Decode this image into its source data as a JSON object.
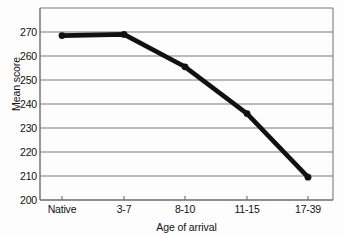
{
  "chart_data": {
    "type": "line",
    "title": "",
    "xlabel": "Age of arrival",
    "ylabel": "Mean score",
    "categories": [
      "Native",
      "3-7",
      "8-10",
      "11-15",
      "17-39"
    ],
    "values": [
      268.5,
      269,
      255.5,
      236,
      209.5
    ],
    "series": [
      {
        "name": "Mean score",
        "values": [
          268.5,
          269,
          255.5,
          236,
          209.5
        ]
      }
    ],
    "ylim": [
      200,
      275
    ],
    "y_ticks": [
      200,
      210,
      220,
      230,
      240,
      250,
      260,
      270
    ],
    "y_tick_labels": [
      "200",
      "210",
      "220",
      "230",
      "240",
      "250",
      "260",
      "270"
    ],
    "x_ticks": [
      "Native",
      "3-7",
      "8-10",
      "11-15",
      "17-39"
    ],
    "grid": "horizontal",
    "legend": "none",
    "line_color": "#111111",
    "marker": "circle",
    "axis_color": "#6b6b6b",
    "grid_color": "#7a7a7a",
    "background": "#fdfdfd"
  }
}
